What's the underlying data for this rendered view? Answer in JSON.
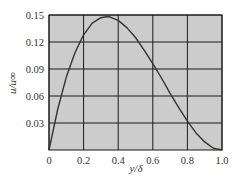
{
  "chart_data": {
    "type": "line",
    "title": "",
    "xlabel": "y/δ",
    "ylabel": "u/u∞",
    "xlim": [
      0,
      1.0
    ],
    "ylim": [
      0,
      0.15
    ],
    "grid": true,
    "xticks": [
      "0",
      "0.2",
      "0.4",
      "0.6",
      "0.8",
      "1.0"
    ],
    "yticks": [
      "0.03",
      "0.06",
      "0.09",
      "0.12",
      "0.15"
    ],
    "series": [
      {
        "name": "u/u∞",
        "color": "#333333",
        "x": [
          0,
          0.05,
          0.1,
          0.15,
          0.2,
          0.25,
          0.3,
          0.333,
          0.35,
          0.4,
          0.45,
          0.5,
          0.55,
          0.6,
          0.65,
          0.7,
          0.75,
          0.8,
          0.85,
          0.9,
          0.95,
          1.0
        ],
        "values": [
          0,
          0.045,
          0.081,
          0.108,
          0.128,
          0.141,
          0.147,
          0.148,
          0.148,
          0.144,
          0.136,
          0.125,
          0.111,
          0.096,
          0.08,
          0.063,
          0.047,
          0.032,
          0.019,
          0.009,
          0.002,
          0
        ]
      }
    ],
    "legend": null,
    "plot_background": "#cccccc"
  },
  "labels": {
    "x_axis": "y/δ",
    "y_axis": "u/u∞"
  }
}
